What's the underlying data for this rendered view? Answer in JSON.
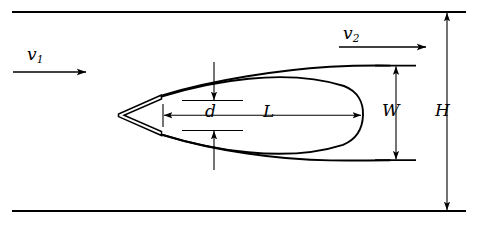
{
  "figure": {
    "type": "technical-line-diagram",
    "width": 478,
    "height": 230,
    "background_color": "#ffffff",
    "line_color": "#000000"
  },
  "labels": {
    "inlet_velocity": "v",
    "inlet_velocity_sub": "1",
    "outlet_velocity": "v",
    "outlet_velocity_sub": "2",
    "wedge_thickness": "d",
    "cavity_length": "L",
    "cavity_width": "W",
    "channel_height": "H"
  },
  "geometry": {
    "top_wall_y": 12,
    "bottom_wall_y": 211,
    "wall_x_start": 12,
    "wall_x_end": 466,
    "wedge_apex_x": 118,
    "wedge_apex_y": 115,
    "wedge_trailing_x": 161,
    "wedge_top_y": 95,
    "wedge_bottom_y": 135,
    "cavity_tip_x": 362,
    "d_dimension_x": 214,
    "d_top_y": 86,
    "d_bottom_y": 145,
    "L_left_x": 163,
    "L_right_x": 362,
    "L_y": 115,
    "W_dimension_x": 396,
    "W_top_y": 66,
    "W_bottom_y": 160,
    "H_dimension_x": 447,
    "v1_arrow_x_start": 13,
    "v1_arrow_x_end": 86,
    "v1_arrow_y": 72,
    "v2_arrow_x_start": 339,
    "v2_arrow_x_end": 426,
    "v2_arrow_y": 47
  }
}
